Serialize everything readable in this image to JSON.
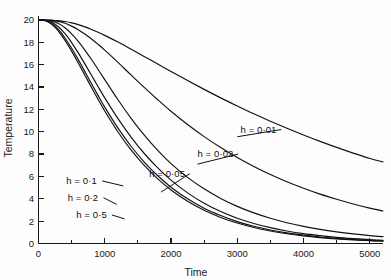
{
  "chart_data": {
    "type": "line",
    "title": "",
    "xlabel": "Time",
    "ylabel": "Temperature",
    "xlim": [
      0,
      5200
    ],
    "ylim": [
      0,
      20.4
    ],
    "grid": false,
    "legend_position": "inline-annotations",
    "x_ticks_major": [
      0,
      1000,
      2000,
      3000,
      4000,
      5000
    ],
    "x_tick_labels": [
      "0",
      "1000",
      "2000",
      "3000",
      "4000",
      "5000"
    ],
    "x_ticks_minor": [
      500,
      1500,
      2500,
      3500,
      4500
    ],
    "y_ticks_major": [
      0,
      2,
      4,
      6,
      8,
      10,
      12,
      14,
      16,
      18,
      20
    ],
    "y_tick_labels": [
      "0",
      "2",
      "4",
      "6",
      "8",
      "10",
      "12",
      "14",
      "16",
      "18",
      "20"
    ],
    "initial_temperature": 20,
    "x": [
      0,
      100,
      200,
      300,
      400,
      500,
      600,
      700,
      800,
      900,
      1000,
      1200,
      1400,
      1600,
      1800,
      2000,
      2250,
      2500,
      2750,
      3000,
      3250,
      3500,
      3750,
      4000,
      4250,
      4500,
      4750,
      5000,
      5200
    ],
    "series": [
      {
        "name": "h = 0·01",
        "h": 0.01,
        "label": "h = 0·01",
        "label_x": 3050,
        "label_y": 10.2,
        "leader_to_x": 3000,
        "leader_to_y": 9.55,
        "values": [
          20.0,
          20.0,
          19.98,
          19.94,
          19.86,
          19.74,
          19.58,
          19.38,
          19.15,
          18.9,
          18.62,
          18.02,
          17.38,
          16.72,
          16.06,
          15.4,
          14.58,
          13.79,
          13.03,
          12.3,
          11.6,
          10.94,
          10.31,
          9.71,
          9.14,
          8.6,
          8.09,
          7.61,
          7.31
        ]
      },
      {
        "name": "h = 0·02",
        "h": 0.02,
        "label": "h = 0·02",
        "label_x": 2400,
        "label_y": 8.0,
        "leader_to_x": 2400,
        "leader_to_y": 7.1,
        "values": [
          20.0,
          20.0,
          19.96,
          19.87,
          19.7,
          19.45,
          19.13,
          18.74,
          18.3,
          17.82,
          17.3,
          16.2,
          15.06,
          13.94,
          12.86,
          11.83,
          10.64,
          9.56,
          8.58,
          7.69,
          6.89,
          6.17,
          5.52,
          4.94,
          4.42,
          3.96,
          3.54,
          3.17,
          2.91
        ]
      },
      {
        "name": "h = 0·05",
        "h": 0.05,
        "label": "h = 0·05",
        "label_x": 1670,
        "label_y": 6.25,
        "leader_to_x": 1850,
        "leader_to_y": 4.6,
        "values": [
          20.0,
          19.99,
          19.9,
          19.68,
          19.3,
          18.76,
          18.09,
          17.31,
          16.46,
          15.57,
          14.66,
          12.86,
          11.18,
          9.67,
          8.33,
          7.15,
          5.92,
          4.89,
          4.03,
          3.32,
          2.74,
          2.26,
          1.86,
          1.53,
          1.26,
          1.04,
          0.86,
          0.71,
          0.61
        ]
      },
      {
        "name": "h = 0·1",
        "h": 0.1,
        "label": "h = 0·1",
        "label_x": 420,
        "label_y": 5.6,
        "leader_to_x": 1280,
        "leader_to_y": 5.15,
        "values": [
          20.0,
          19.97,
          19.79,
          19.39,
          18.77,
          17.98,
          17.06,
          16.07,
          15.05,
          14.03,
          13.03,
          11.17,
          9.5,
          8.03,
          6.76,
          5.67,
          4.53,
          3.6,
          2.86,
          2.26,
          1.79,
          1.42,
          1.12,
          0.88,
          0.7,
          0.55,
          0.44,
          0.35,
          0.29
        ]
      },
      {
        "name": "h = 0·2",
        "h": 0.2,
        "label": "h = 0·2",
        "label_x": 440,
        "label_y": 4.1,
        "leader_to_x": 1180,
        "leader_to_y": 3.5,
        "values": [
          20.0,
          19.95,
          19.69,
          19.15,
          18.39,
          17.47,
          16.45,
          15.38,
          14.3,
          13.23,
          12.2,
          10.32,
          8.68,
          7.26,
          6.06,
          5.04,
          4.0,
          3.16,
          2.5,
          1.96,
          1.54,
          1.21,
          0.95,
          0.75,
          0.58,
          0.46,
          0.36,
          0.28,
          0.24
        ]
      },
      {
        "name": "h = 0·5",
        "h": 0.5,
        "label": "h = 0·5",
        "label_x": 570,
        "label_y": 2.55,
        "leader_to_x": 1300,
        "leader_to_y": 2.2,
        "values": [
          20.0,
          19.93,
          19.61,
          19.0,
          18.17,
          17.21,
          16.15,
          15.06,
          13.96,
          12.89,
          11.86,
          9.98,
          8.35,
          6.96,
          5.78,
          4.79,
          3.78,
          2.97,
          2.33,
          1.83,
          1.43,
          1.12,
          0.87,
          0.68,
          0.53,
          0.41,
          0.32,
          0.25,
          0.21
        ]
      }
    ]
  },
  "figure": {
    "background_color": "#fdfdfd",
    "line_color": "#111111",
    "text_color": "#1a1a1a"
  }
}
